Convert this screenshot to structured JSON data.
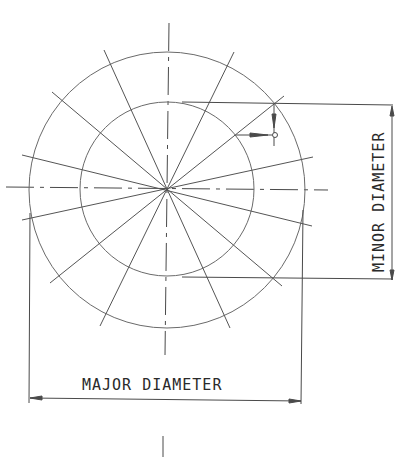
{
  "diagram": {
    "type": "thread-diameter-drawing",
    "labels": {
      "major": "MAJOR DIAMETER",
      "minor": "MINOR DIAMETER"
    },
    "geometry": {
      "center": [
        167,
        189
      ],
      "major_radius": 138,
      "minor_radius": 87,
      "radial_line_count": 16
    },
    "colors": {
      "line": "#4a4a4a",
      "background": "#ffffff"
    }
  }
}
